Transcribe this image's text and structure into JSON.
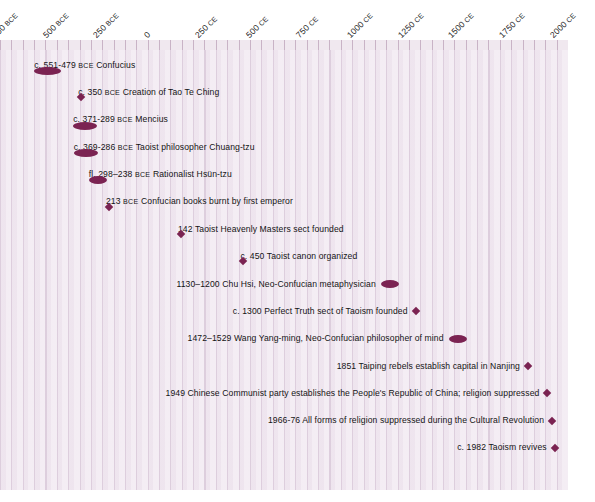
{
  "chart_data": {
    "type": "timeline",
    "title": "",
    "xlabel": "",
    "ylabel": "",
    "xlim": [
      -750,
      2050
    ],
    "grid": true,
    "legend": "none",
    "axis_ticks": [
      {
        "value": -750,
        "label": "750",
        "era": "BCE"
      },
      {
        "value": -500,
        "label": "500",
        "era": "BCE"
      },
      {
        "value": -250,
        "label": "250",
        "era": "BCE"
      },
      {
        "value": 0,
        "label": "0",
        "era": ""
      },
      {
        "value": 250,
        "label": "250",
        "era": "CE"
      },
      {
        "value": 500,
        "label": "500",
        "era": "CE"
      },
      {
        "value": 750,
        "label": "750",
        "era": "CE"
      },
      {
        "value": 1000,
        "label": "1000",
        "era": "CE"
      },
      {
        "value": 1250,
        "label": "1250",
        "era": "CE"
      },
      {
        "value": 1500,
        "label": "1500",
        "era": "CE"
      },
      {
        "value": 1750,
        "label": "1750",
        "era": "CE"
      },
      {
        "value": 2000,
        "label": "2000",
        "era": "CE"
      }
    ],
    "marker_color": "#7b2352",
    "background_color": "#efe6ef",
    "events": [
      {
        "date_text": "c. 551-479 ",
        "era": "BCE",
        "description": "  Confucius",
        "marker": "range",
        "marker_size": "wide",
        "marker_placement": "below",
        "start": -551,
        "end": -479
      },
      {
        "date_text": "c. 350 ",
        "era": "BCE",
        "description": "  Creation of Tao Te Ching",
        "marker": "point",
        "marker_placement": "below",
        "start": -350,
        "end": -350
      },
      {
        "date_text": "c. 371-289 ",
        "era": "BCE",
        "description": "  Mencius",
        "marker": "range",
        "marker_size": "normal",
        "marker_placement": "below",
        "start": -371,
        "end": -289
      },
      {
        "date_text": "c. 369-286 ",
        "era": "BCE",
        "description": "  Taoist philosopher Chuang-tzu",
        "marker": "range",
        "marker_size": "normal",
        "marker_placement": "below",
        "start": -369,
        "end": -286
      },
      {
        "date_text": "fl. 298–238 ",
        "era": "BCE",
        "description": "  Rationalist Hsün-tzu",
        "marker": "range",
        "marker_size": "narrow",
        "marker_placement": "below",
        "start": -298,
        "end": -238
      },
      {
        "date_text": "213 ",
        "era": "BCE",
        "description": "  Confucian books burnt by first emperor",
        "marker": "point",
        "marker_placement": "below",
        "start": -213,
        "end": -213
      },
      {
        "date_text": "142",
        "era": "",
        "description": "  Taoist Heavenly Masters sect founded",
        "marker": "point",
        "marker_placement": "below",
        "start": 142,
        "end": 142
      },
      {
        "date_text": "c. 450",
        "era": "",
        "description": "  Taoist canon organized",
        "marker": "point",
        "marker_placement": "below",
        "start": 450,
        "end": 450
      },
      {
        "date_text": "1130–1200",
        "era": "",
        "description": "  Chu Hsi, Neo-Confucian metaphysician",
        "marker": "range",
        "marker_size": "narrow",
        "marker_placement": "inline",
        "start": 1130,
        "end": 1200
      },
      {
        "date_text": "c. 1300",
        "era": "",
        "description": "  Perfect Truth sect of Taoism founded",
        "marker": "point",
        "marker_placement": "inline",
        "start": 1300,
        "end": 1300
      },
      {
        "date_text": "1472–1529",
        "era": "",
        "description": "  Wang Yang-ming, Neo-Confucian philosopher of mind",
        "marker": "range",
        "marker_size": "narrow",
        "marker_placement": "inline",
        "start": 1472,
        "end": 1529
      },
      {
        "date_text": "1851",
        "era": "",
        "description": "  Taiping rebels establish capital in Nanjing",
        "marker": "point",
        "marker_placement": "inline",
        "start": 1851,
        "end": 1851
      },
      {
        "date_text": "1949",
        "era": "",
        "description": "  Chinese Communist party establishes the People's Republic of China; religion suppressed",
        "marker": "point",
        "marker_placement": "inline",
        "start": 1949,
        "end": 1949
      },
      {
        "date_text": "1966-76",
        "era": "",
        "description": "  All forms of religion suppressed during the Cultural Revolution",
        "marker": "point",
        "marker_placement": "inline",
        "start": 1966,
        "end": 1976
      },
      {
        "date_text": "c. 1982",
        "era": "",
        "description": "  Taoism revives",
        "marker": "point",
        "marker_placement": "inline",
        "start": 1982,
        "end": 1982
      }
    ]
  }
}
